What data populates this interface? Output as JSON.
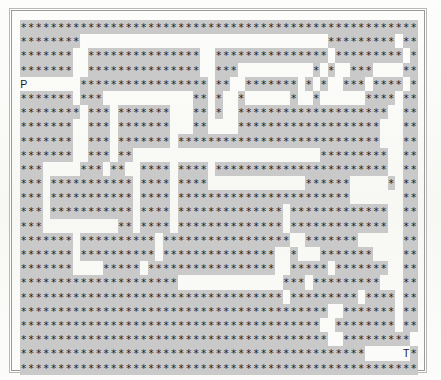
{
  "page": {
    "background_color": "#fbfbf9",
    "frame_color": "#9a9a9a"
  },
  "maze": {
    "wall_char": "*",
    "wall_color": "#c9c9c9",
    "glyph_color": "#1c1c1c",
    "columns": 53,
    "rows": 25,
    "cell_width_px": 7.5,
    "cell_height_px": 14.2,
    "legend": {
      "start_label": "P",
      "target_label": "T"
    },
    "markers": [
      {
        "label": "P",
        "row": 4,
        "col": 0
      },
      {
        "label": "T",
        "row": 23,
        "col": 51
      }
    ],
    "grid": [
      "*****************************************************",
      "********.................................*********.****",
      "*******..***************..***************.*********.****",
      "*******..***************..***..........*.*..***....*****",
      "........*****************.**..*******.*.*..***.****.****",
      "*******.***............**.*..*......*..*......****.*****",
      "********.***.*******...**.*..********************..*****",
      "*******..***.*******...**....*******************...*****",
      "*******..***.*******.***************************...*****",
      "*******..***.**.........................*********..*****",
      "***.....***.**..****.****.***********************..*****",
      "***.***********.****.****.............******.....*.*****",
      "***.***********.****.***********************.......*****",
      "***.***********.****.**************.*************..*****",
      "***..........**.****.**************.*************..*****",
      "*******.**********.*****************..*******......*****",
      "*******.**********.***************..*...*******....*****",
      "*******....*****.*****************..*****.*******..*****",
      "*********************..............***.*********...*****",
      "***********************************.*********.****.*****",
      "*****************************************..*******.*****",
      "****************************************..********.*****",
      "*****************************************..*********.***",
      "**********************************************......****",
      "*****************************************************"
    ]
  }
}
